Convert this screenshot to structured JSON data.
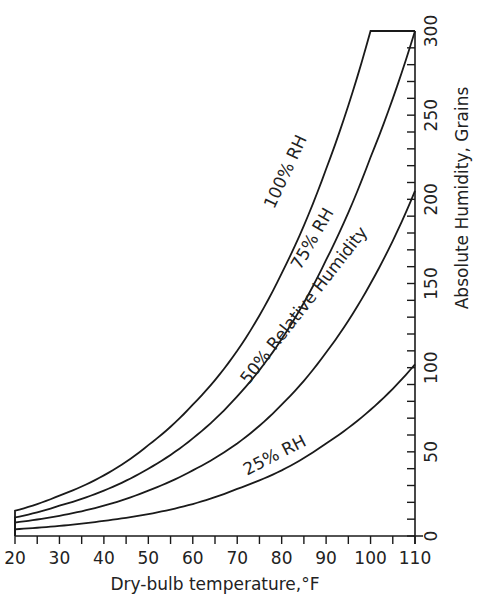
{
  "chart_data": {
    "type": "line",
    "title": "",
    "xlabel": "Dry-bulb temperature,°F",
    "ylabel": "Absolute Humidity, Grains",
    "xlim": [
      20,
      110
    ],
    "ylim": [
      0,
      300
    ],
    "x_ticks": [
      20,
      30,
      40,
      50,
      60,
      70,
      80,
      90,
      100,
      110
    ],
    "x_minor_step": 5,
    "y_ticks": [
      0,
      50,
      100,
      150,
      200,
      250,
      300
    ],
    "y_minor_step": 10,
    "y_axis_position": "right",
    "grid": false,
    "legend": "none (inline curve labels)",
    "x": [
      20,
      30,
      40,
      50,
      60,
      70,
      80,
      90,
      100,
      110
    ],
    "series": [
      {
        "name": "100% RH",
        "values": [
          15,
          24,
          36,
          54,
          78,
          110,
          156,
          218,
          300,
          300
        ],
        "note": "capped at 300 grains from ~100.5°F to 110°F"
      },
      {
        "name": "75% RH",
        "values": [
          11,
          18,
          27,
          40,
          58,
          83,
          117,
          164,
          225,
          300
        ]
      },
      {
        "name": "50% Relative Humidity",
        "values": [
          8,
          12,
          18,
          27,
          39,
          55,
          78,
          109,
          150,
          205
        ]
      },
      {
        "name": "25% RH",
        "values": [
          4,
          6,
          9,
          13,
          19,
          28,
          39,
          55,
          75,
          102
        ]
      }
    ],
    "annotations": [
      {
        "text": "100% RH",
        "x": 82,
        "y": 215,
        "angle": -65
      },
      {
        "text": "75% RH",
        "x": 88,
        "y": 175,
        "angle": -60
      },
      {
        "text": "50% Relative Humidity",
        "x": 86,
        "y": 135,
        "angle": -52
      },
      {
        "text": "25% RH",
        "x": 79,
        "y": 45,
        "angle": -27
      }
    ]
  }
}
